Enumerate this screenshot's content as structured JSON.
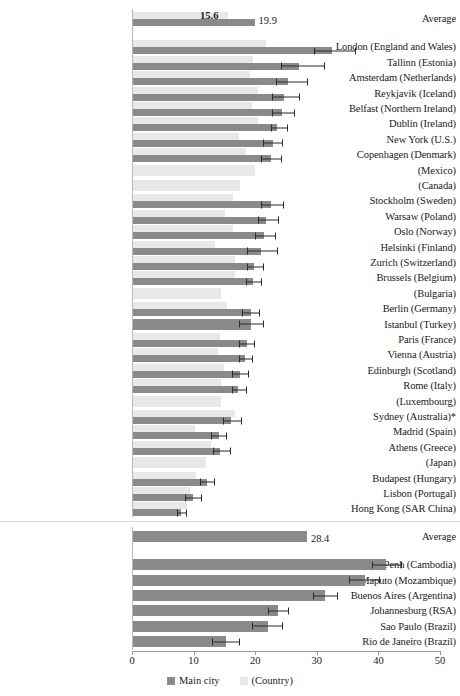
{
  "chart_data": {
    "type": "bar",
    "orientation": "horizontal",
    "title": "",
    "xlabel": "",
    "ylabel": "",
    "xlim": [
      0,
      50
    ],
    "xticks": [
      0,
      10,
      20,
      30,
      40,
      50
    ],
    "grid": false,
    "legend": {
      "position": "bottom-center",
      "entries": [
        {
          "name": "Main city",
          "color": "#8a8a8a"
        },
        {
          "name": "(Country)",
          "color": "#e8e8e8"
        }
      ]
    },
    "series": [
      {
        "name": "Main city",
        "color": "#8a8a8a"
      },
      {
        "name": "(Country)",
        "color": "#e8e8e8"
      }
    ],
    "sections": [
      {
        "name": "upper",
        "average": {
          "label": "Average",
          "country": 15.6,
          "city": 19.9,
          "country_value_label": "15.6",
          "city_value_label": "19.9"
        },
        "rows": [
          {
            "label": "London (England and Wales)",
            "country": 21.8,
            "city": 32.5,
            "ci_low": 29.5,
            "ci_high": 36.3
          },
          {
            "label": "Tallinn (Estonia)",
            "country": 19.6,
            "city": 27.1,
            "ci_low": 24.2,
            "ci_high": 31.4
          },
          {
            "label": "Amsterdam (Netherlands)",
            "country": 19.2,
            "city": 25.4,
            "ci_low": 23.3,
            "ci_high": 28.5
          },
          {
            "label": "Reykjavik (Iceland)",
            "country": 20.4,
            "city": 24.6,
            "ci_low": 22.8,
            "ci_high": 27.3
          },
          {
            "label": "Belfast (Northern Ireland)",
            "country": 19.4,
            "city": 24.3,
            "ci_low": 22.8,
            "ci_high": 26.4
          },
          {
            "label": "Dublin (Ireland)",
            "country": 20.4,
            "city": 23.5,
            "ci_low": 22.6,
            "ci_high": 25.3
          },
          {
            "label": "New York (U.S.)",
            "country": 17.4,
            "city": 22.9,
            "ci_low": 21.3,
            "ci_high": 24.5
          },
          {
            "label": "Copenhagen (Denmark)",
            "country": 18.5,
            "city": 22.6,
            "ci_low": 21.0,
            "ci_high": 24.3
          },
          {
            "label": "(Mexico)",
            "country": 20.0,
            "city": null,
            "ci_low": null,
            "ci_high": null
          },
          {
            "label": "(Canada)",
            "country": 17.6,
            "city": null,
            "ci_low": null,
            "ci_high": null
          },
          {
            "label": "Stockholm (Sweden)",
            "country": 16.4,
            "city": 22.6,
            "ci_low": 21.0,
            "ci_high": 24.6
          },
          {
            "label": "Warsaw (Poland)",
            "country": 15.1,
            "city": 21.8,
            "ci_low": 20.4,
            "ci_high": 23.9
          },
          {
            "label": "Oslo (Norway)",
            "country": 16.4,
            "city": 21.5,
            "ci_low": 20.0,
            "ci_high": 23.3
          },
          {
            "label": "Helsinki (Finland)",
            "country": 13.4,
            "city": 21.0,
            "ci_low": 18.6,
            "ci_high": 23.7
          },
          {
            "label": "Zurich (Switzerland)",
            "country": 16.7,
            "city": 19.8,
            "ci_low": 18.7,
            "ci_high": 21.4
          },
          {
            "label": "Brussels (Belgium)",
            "country": 16.8,
            "city": 19.7,
            "ci_low": 18.5,
            "ci_high": 21.1
          },
          {
            "label": "(Bulgaria)",
            "country": 14.5,
            "city": null,
            "ci_low": null,
            "ci_high": null
          },
          {
            "label": "Berlin (Germany)",
            "country": 15.5,
            "city": 19.3,
            "ci_low": 17.8,
            "ci_high": 20.8
          },
          {
            "label": "Istanbul (Turkey)",
            "country": null,
            "city": 19.3,
            "ci_low": 17.3,
            "ci_high": 21.4
          },
          {
            "label": "Paris (France)",
            "country": 14.3,
            "city": 18.6,
            "ci_low": 17.3,
            "ci_high": 20.0
          },
          {
            "label": "Vienna (Austria)",
            "country": 13.9,
            "city": 18.4,
            "ci_low": 17.3,
            "ci_high": 19.7
          },
          {
            "label": "Edinburgh (Scotland)",
            "country": 15.0,
            "city": 17.5,
            "ci_low": 16.2,
            "ci_high": 19.0
          },
          {
            "label": "Rome (Italy)",
            "country": 14.4,
            "city": 17.2,
            "ci_low": 16.2,
            "ci_high": 18.7
          },
          {
            "label": "(Luxembourg)",
            "country": 14.4,
            "city": null,
            "ci_low": null,
            "ci_high": null
          },
          {
            "label": "Sydney (Australia)*",
            "country": 16.7,
            "city": 16.1,
            "ci_low": 14.7,
            "ci_high": 17.9
          },
          {
            "label": "Madrid (Spain)",
            "country": 10.3,
            "city": 14.1,
            "ci_low": 12.8,
            "ci_high": 15.5
          },
          {
            "label": "Athens (Greece)",
            "country": 12.8,
            "city": 14.3,
            "ci_low": 13.1,
            "ci_high": 16.0
          },
          {
            "label": "(Japan)",
            "country": 12.0,
            "city": null,
            "ci_low": null,
            "ci_high": null
          },
          {
            "label": "Budapest (Hungary)",
            "country": 10.4,
            "city": 12.2,
            "ci_low": 11.1,
            "ci_high": 13.4
          },
          {
            "label": "Lisbon (Portugal)",
            "country": 9.4,
            "city": 9.9,
            "ci_low": 8.6,
            "ci_high": 11.4
          },
          {
            "label": "Hong Kong (SAR China)",
            "country": 9.0,
            "city": 8.0,
            "ci_low": 7.3,
            "ci_high": 8.9
          }
        ]
      },
      {
        "name": "lower",
        "average": {
          "label": "Average",
          "country": null,
          "city": 28.4,
          "country_value_label": "",
          "city_value_label": "28.4"
        },
        "rows": [
          {
            "label": "Phnom Penh (Cambodia)",
            "country": null,
            "city": 41.2,
            "ci_low": 39.0,
            "ci_high": 43.8
          },
          {
            "label": "Maputo (Mozambique)",
            "country": null,
            "city": 37.8,
            "ci_low": 35.2,
            "ci_high": 40.3
          },
          {
            "label": "Buenos Aires (Argentina)",
            "country": null,
            "city": 31.3,
            "ci_low": 29.4,
            "ci_high": 33.4
          },
          {
            "label": "Johannesburg (RSA)",
            "country": null,
            "city": 23.7,
            "ci_low": 22.0,
            "ci_high": 25.5
          },
          {
            "label": "Sao Paulo (Brazil)",
            "country": null,
            "city": 22.0,
            "ci_low": 19.5,
            "ci_high": 24.5
          },
          {
            "label": "Rio de Janeiro (Brazil)",
            "country": null,
            "city": 15.2,
            "ci_low": 13.0,
            "ci_high": 17.5
          }
        ]
      }
    ]
  }
}
